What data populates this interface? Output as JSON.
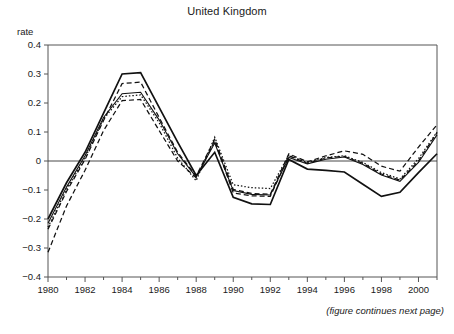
{
  "figure": {
    "title": "United Kingdom",
    "note": "(figure continues next page)",
    "y_axis_label": "rate"
  },
  "chart_data": {
    "type": "line",
    "title": "United Kingdom",
    "xlabel": "",
    "ylabel": "rate",
    "xlim": [
      1980,
      2001
    ],
    "ylim": [
      -0.4,
      0.4
    ],
    "grid": false,
    "legend": "none",
    "annotations": [
      "(figure continues next page)"
    ],
    "y_ticks": [
      0.4,
      0.3,
      0.2,
      0.1,
      0,
      -0.1,
      -0.2,
      -0.3,
      -0.4
    ],
    "y_tick_labels": [
      "0.4",
      "0.3",
      "0.2",
      "0.1",
      "0",
      "-0.1",
      "-0.2",
      "-0.3",
      "-0.4"
    ],
    "x_ticks": [
      1980,
      1982,
      1984,
      1986,
      1988,
      1990,
      1992,
      1994,
      1996,
      1998,
      2000
    ],
    "x_tick_labels": [
      "1980",
      "1982",
      "1984",
      "1986",
      "1988",
      "1990",
      "1992",
      "1994",
      "1996",
      "1998",
      "2000"
    ],
    "x_minor_ticks": [
      1981,
      1983,
      1985,
      1987,
      1989,
      1991,
      1993,
      1995,
      1997,
      1999,
      2001
    ],
    "x": [
      1980,
      1981,
      1982,
      1983,
      1984,
      1985,
      1986,
      1987,
      1988,
      1989,
      1990,
      1991,
      1992,
      1993,
      1994,
      1995,
      1996,
      1997,
      1998,
      1999,
      2000,
      2001
    ],
    "series": [
      {
        "name": "series-1",
        "style": "solid-bold",
        "stroke_width": 1.7,
        "dash": "",
        "values": [
          -0.2,
          -0.075,
          0.03,
          0.165,
          0.3,
          0.305,
          0.185,
          0.065,
          -0.05,
          0.03,
          -0.125,
          -0.148,
          -0.15,
          0.005,
          -0.028,
          -0.032,
          -0.038,
          -0.08,
          -0.122,
          -0.108,
          -0.04,
          0.025
        ]
      },
      {
        "name": "series-2",
        "style": "dashed-upper",
        "stroke_width": 1.25,
        "dash": "5,3",
        "values": [
          -0.235,
          -0.105,
          0.005,
          0.14,
          0.267,
          0.272,
          0.15,
          0.03,
          -0.052,
          0.075,
          -0.098,
          -0.112,
          -0.115,
          0.025,
          -0.003,
          0.018,
          0.035,
          0.023,
          -0.018,
          -0.035,
          0.048,
          0.125
        ]
      },
      {
        "name": "series-3",
        "style": "solid-thin",
        "stroke_width": 1.1,
        "dash": "",
        "values": [
          -0.215,
          -0.09,
          0.018,
          0.15,
          0.232,
          0.237,
          0.142,
          0.025,
          -0.055,
          0.062,
          -0.102,
          -0.115,
          -0.117,
          0.012,
          -0.01,
          0.006,
          0.014,
          -0.012,
          -0.048,
          -0.07,
          -0.005,
          0.09
        ]
      },
      {
        "name": "series-4",
        "style": "dotted",
        "stroke_width": 1.25,
        "dash": "1.5,2",
        "values": [
          -0.228,
          -0.098,
          0.01,
          0.145,
          0.222,
          0.228,
          0.132,
          0.01,
          -0.068,
          0.082,
          -0.082,
          -0.092,
          -0.095,
          0.02,
          -0.006,
          0.012,
          0.018,
          -0.005,
          -0.04,
          -0.062,
          0.008,
          0.1
        ]
      },
      {
        "name": "series-5",
        "style": "dashed-lower",
        "stroke_width": 1.25,
        "dash": "5,3",
        "values": [
          -0.315,
          -0.155,
          -0.032,
          0.105,
          0.208,
          0.212,
          0.105,
          0.0,
          -0.058,
          0.07,
          -0.11,
          -0.12,
          -0.122,
          0.018,
          -0.008,
          0.01,
          0.016,
          -0.008,
          -0.045,
          -0.066,
          0.0,
          0.098
        ]
      }
    ]
  },
  "plot_geometry": {
    "left": 48,
    "right": 437,
    "top": 45,
    "bottom": 277
  }
}
